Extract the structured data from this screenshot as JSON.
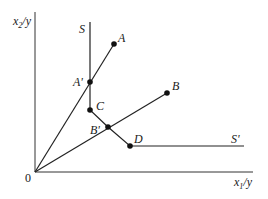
{
  "diagram": {
    "type": "isoquant-activity-analysis",
    "axes": {
      "x_label_main": "x",
      "x_label_sub": "1",
      "x_label_tail": "/y",
      "y_label_main": "x",
      "y_label_sub": "2",
      "y_label_tail": "/y",
      "origin_label": "0"
    },
    "isoquant": {
      "start_label": "S",
      "end_label": "S'"
    },
    "points": [
      {
        "id": "A",
        "label": "A",
        "x": 114,
        "y": 44
      },
      {
        "id": "A_prime",
        "label": "A'",
        "x": 90,
        "y": 82
      },
      {
        "id": "C",
        "label": "C",
        "x": 90,
        "y": 110
      },
      {
        "id": "B_prime",
        "label": "B'",
        "x": 108,
        "y": 127
      },
      {
        "id": "B",
        "label": "B",
        "x": 167,
        "y": 93
      },
      {
        "id": "D",
        "label": "D",
        "x": 130,
        "y": 146
      }
    ],
    "rays": [
      {
        "from": "0",
        "to": "A"
      },
      {
        "from": "0",
        "to": "B"
      }
    ],
    "colors": {
      "line": "#222222",
      "background": "#ffffff"
    }
  }
}
